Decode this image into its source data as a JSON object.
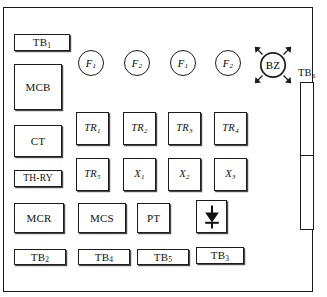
{
  "diagram": {
    "type": "electrical-panel-layout",
    "colors": {
      "line": "#1c1c1c",
      "background": "#ffffff",
      "shadow": "#4a4a4a"
    },
    "left_column": [
      {
        "id": "tb1",
        "label": "TB",
        "sub": "1",
        "shape": "rect-thin"
      },
      {
        "id": "mcb",
        "label": "MCB",
        "sub": "",
        "shape": "rect-large"
      },
      {
        "id": "ct",
        "label": "CT",
        "sub": "",
        "shape": "rect-medium"
      },
      {
        "id": "thry",
        "label": "TH-RY",
        "sub": "",
        "shape": "rect-thin"
      },
      {
        "id": "mcr",
        "label": "MCR",
        "sub": "",
        "shape": "rect-medium"
      },
      {
        "id": "tb2",
        "label": "TB",
        "sub": "2",
        "shape": "rect-thin"
      }
    ],
    "fuses": [
      {
        "id": "f1a",
        "label": "F",
        "sub": "1",
        "shape": "circle"
      },
      {
        "id": "f2a",
        "label": "F",
        "sub": "2",
        "shape": "circle"
      },
      {
        "id": "f1b",
        "label": "F",
        "sub": "1",
        "shape": "circle"
      },
      {
        "id": "f2b",
        "label": "F",
        "sub": "2",
        "shape": "circle"
      }
    ],
    "buzzer": {
      "id": "bz",
      "label": "BZ",
      "sub": "",
      "shape": "circle-radiating"
    },
    "relay_row_1": [
      {
        "id": "tr1",
        "label": "TR",
        "sub": "1",
        "shape": "square"
      },
      {
        "id": "tr2",
        "label": "TR",
        "sub": "2",
        "shape": "square"
      },
      {
        "id": "tr3",
        "label": "TR",
        "sub": "3",
        "shape": "square"
      },
      {
        "id": "tr4",
        "label": "TR",
        "sub": "4",
        "shape": "square"
      }
    ],
    "relay_row_2": [
      {
        "id": "tr5",
        "label": "TR",
        "sub": "5",
        "shape": "square"
      },
      {
        "id": "x1",
        "label": "X",
        "sub": "1",
        "shape": "square"
      },
      {
        "id": "x2",
        "label": "X",
        "sub": "2",
        "shape": "square"
      },
      {
        "id": "x3",
        "label": "X",
        "sub": "3",
        "shape": "square"
      }
    ],
    "bottom_row": [
      {
        "id": "mcs",
        "label": "MCS",
        "sub": "",
        "shape": "rect-medium"
      },
      {
        "id": "pt",
        "label": "PT",
        "sub": "",
        "shape": "square"
      },
      {
        "id": "diode",
        "label": "",
        "sub": "",
        "shape": "square-diode"
      }
    ],
    "terminal_row": [
      {
        "id": "tb2b",
        "label": "TB",
        "sub": "2",
        "shape": "rect-thin"
      },
      {
        "id": "tb4",
        "label": "TB",
        "sub": "4",
        "shape": "rect-thin"
      },
      {
        "id": "tb5",
        "label": "TB",
        "sub": "5",
        "shape": "rect-thin"
      },
      {
        "id": "tb3",
        "label": "TB",
        "sub": "3",
        "shape": "rect-thin"
      }
    ],
    "terminal_strip": {
      "id": "tb6",
      "label": "TB",
      "sub": "6",
      "shape": "vertical-strip",
      "segments": 2
    }
  }
}
